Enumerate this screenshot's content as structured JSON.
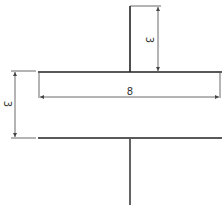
{
  "diagram": {
    "type": "technical-drawing",
    "colors": {
      "line": "#222222",
      "dim": "#444444",
      "background": "#ffffff"
    },
    "dimensions": [
      {
        "id": "stem-height",
        "label": "3",
        "orientation": "vertical-rotated"
      },
      {
        "id": "flange-width",
        "label": "8",
        "orientation": "horizontal"
      },
      {
        "id": "flange-thickness",
        "label": "3",
        "orientation": "vertical-rotated"
      }
    ]
  }
}
